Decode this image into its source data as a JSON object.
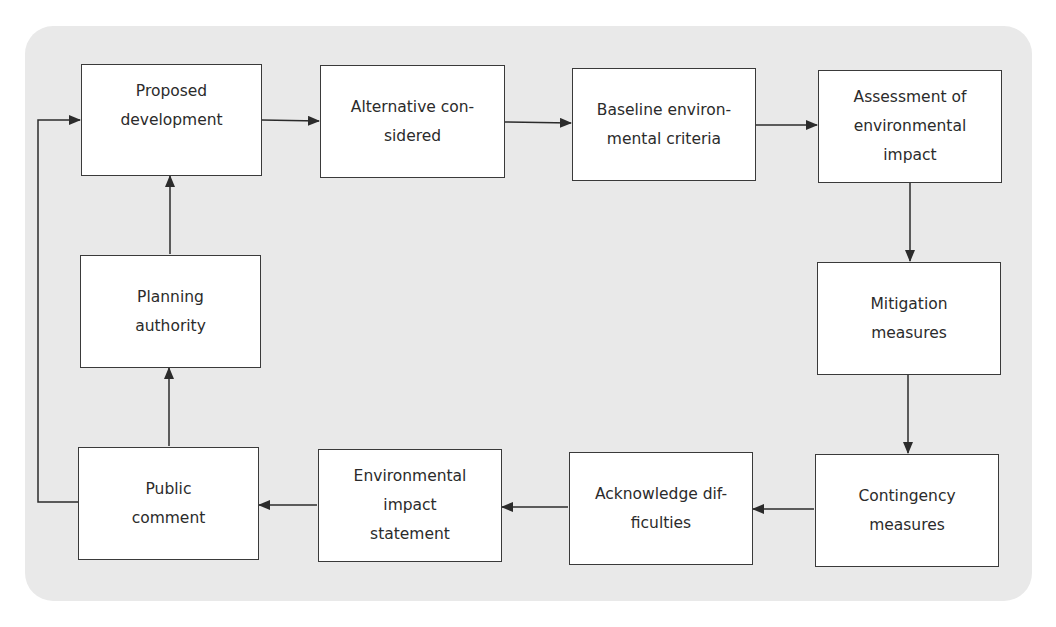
{
  "diagram": {
    "type": "flowchart",
    "background_color": "#e9e9e9",
    "box_fill": "#ffffff",
    "line_color": "#2b2b2b",
    "nodes": [
      {
        "id": "proposed",
        "label": "Proposed\ndevelopment"
      },
      {
        "id": "alternative",
        "label": "Alternative con-\nsidered"
      },
      {
        "id": "baseline",
        "label": "Baseline environ-\nmental criteria"
      },
      {
        "id": "assessment",
        "label": "Assessment of\nenvironmental\nimpact"
      },
      {
        "id": "mitigation",
        "label": "Mitigation\nmeasures"
      },
      {
        "id": "contingency",
        "label": "Contingency\nmeasures"
      },
      {
        "id": "acknowledge",
        "label": "Acknowledge dif-\nficulties"
      },
      {
        "id": "eis",
        "label": "Environmental\nimpact\nstatement"
      },
      {
        "id": "public",
        "label": "Public\ncomment"
      },
      {
        "id": "planning",
        "label": "Planning\nauthority"
      }
    ],
    "edges": [
      {
        "from": "proposed",
        "to": "alternative"
      },
      {
        "from": "alternative",
        "to": "baseline"
      },
      {
        "from": "baseline",
        "to": "assessment"
      },
      {
        "from": "assessment",
        "to": "mitigation"
      },
      {
        "from": "mitigation",
        "to": "contingency"
      },
      {
        "from": "contingency",
        "to": "acknowledge"
      },
      {
        "from": "acknowledge",
        "to": "eis"
      },
      {
        "from": "eis",
        "to": "public"
      },
      {
        "from": "public",
        "to": "planning"
      },
      {
        "from": "planning",
        "to": "proposed"
      },
      {
        "from": "public",
        "to": "proposed"
      }
    ]
  }
}
